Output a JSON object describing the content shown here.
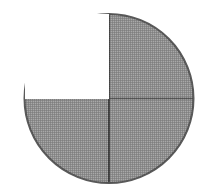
{
  "figure": {
    "shape": "circle",
    "canvas": {
      "width": 215,
      "height": 193,
      "background_color": "#ffffff"
    },
    "circle": {
      "center_x": 109,
      "center_y": 98.5,
      "radius": 84.5,
      "left_edge_x": 24,
      "right_edge_x": 194,
      "top_edge_y": 14,
      "bottom_edge_y": 183,
      "outline_color": "#5a5a5a",
      "outline_width": 2
    },
    "dividers": [
      {
        "id": "vertical-diameter",
        "orientation": "vertical",
        "position_x": 109,
        "from_y": 14,
        "to_y": 183,
        "color": "#4f4f4f",
        "width": 2
      },
      {
        "id": "horizontal-diameter",
        "orientation": "horizontal",
        "position_y": 98.5,
        "from_x": 24,
        "to_x": 194,
        "color": "#6b6b6b",
        "width": 1.5
      }
    ],
    "fill_colors": {
      "shaded": "#a9a9a9",
      "unshaded": "#ffffff"
    },
    "quadrants": [
      {
        "id": "upper-left",
        "label": "Upper left quadrant",
        "shaded": false,
        "fill": "#ffffff",
        "start_angle_deg": 180,
        "end_angle_deg": 270
      },
      {
        "id": "upper-right",
        "label": "Upper right quadrant",
        "shaded": true,
        "fill": "#a9a9a9",
        "start_angle_deg": 270,
        "end_angle_deg": 360
      },
      {
        "id": "lower-right",
        "label": "Lower right quadrant",
        "shaded": true,
        "fill": "#a9a9a9",
        "start_angle_deg": 0,
        "end_angle_deg": 90
      },
      {
        "id": "lower-left",
        "label": "Lower left quadrant",
        "shaded": true,
        "fill": "#a9a9a9",
        "start_angle_deg": 90,
        "end_angle_deg": 180
      }
    ],
    "counts": {
      "total_parts": 4,
      "shaded_parts": 3,
      "unshaded_parts": 1
    },
    "fraction_shaded": "3/4",
    "percent_shaded": 75
  }
}
